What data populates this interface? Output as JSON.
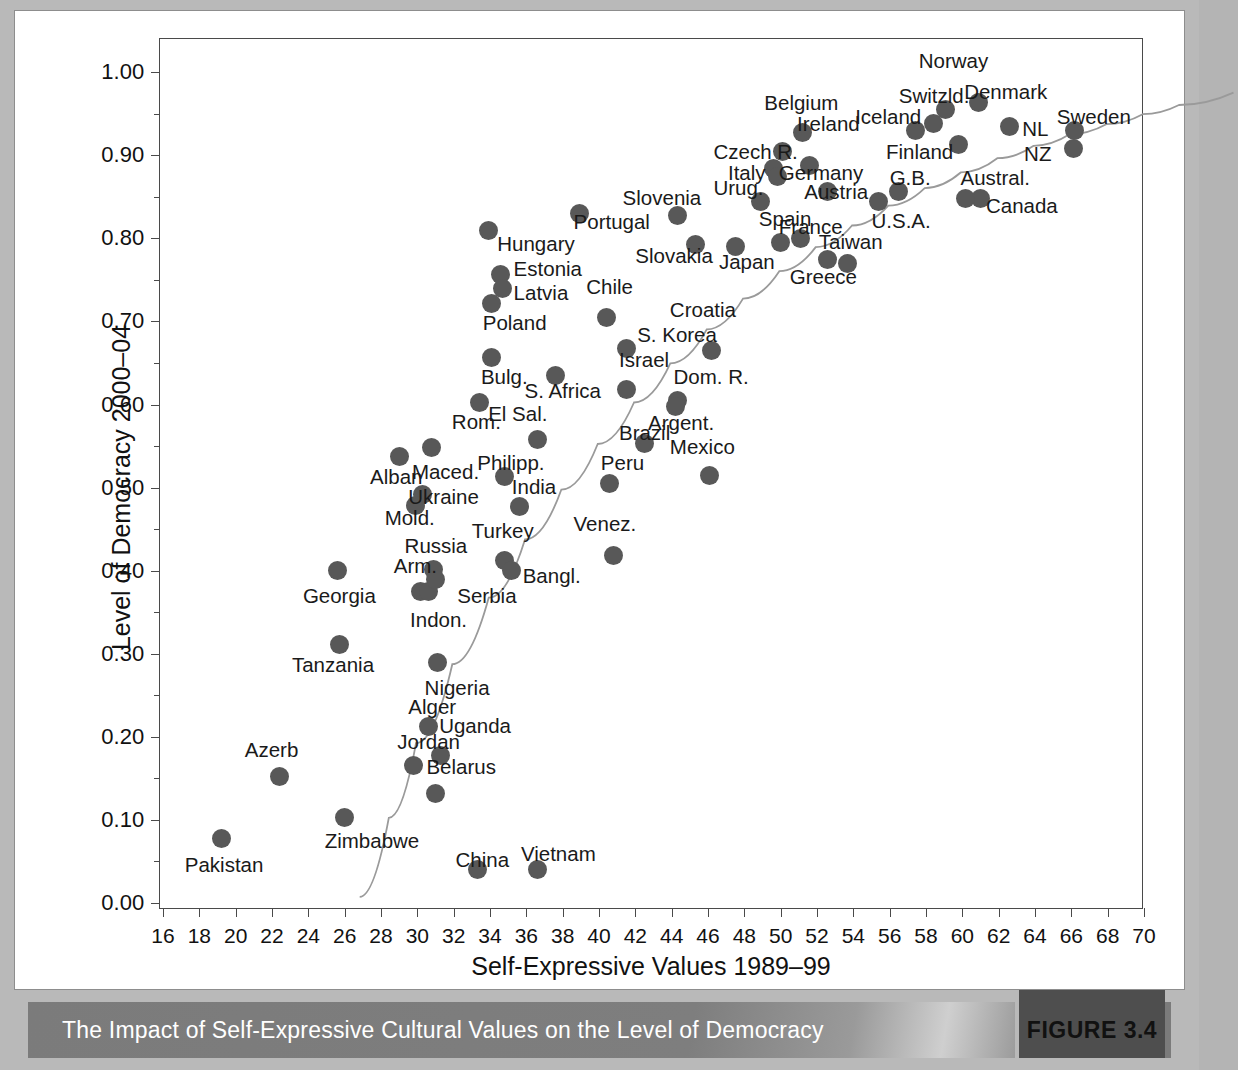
{
  "figure": {
    "caption": "The Impact of Self-Expressive Cultural Values on the Level of Democracy",
    "number_label": "FIGURE 3.4",
    "accent_color": "#7b7b7b",
    "marker_color": "#585858",
    "page_background": "#b9b9b9"
  },
  "chart_data": {
    "type": "scatter",
    "title": "The Impact of Self-Expressive Cultural Values on the Level of Democracy",
    "xlabel": "Self-Expressive Values 1989–99",
    "ylabel": "Level of Democracy 2000–04",
    "xlim": [
      16,
      70
    ],
    "ylim": [
      0.0,
      1.04
    ],
    "grid": false,
    "legend": null,
    "x_ticks": [
      16,
      18,
      20,
      22,
      24,
      26,
      28,
      30,
      32,
      34,
      36,
      38,
      40,
      42,
      44,
      46,
      48,
      50,
      52,
      54,
      56,
      58,
      60,
      62,
      64,
      66,
      68,
      70
    ],
    "x_tick_labels": [
      "16",
      "18",
      "20",
      "22",
      "24",
      "26",
      "28",
      "30",
      "32",
      "34",
      "36",
      "38",
      "40",
      "42",
      "44",
      "46",
      "48",
      "50",
      "52",
      "54",
      "56",
      "58",
      "60",
      "62",
      "64",
      "66",
      "68",
      "70"
    ],
    "y_ticks": [
      0.0,
      0.05,
      0.1,
      0.15,
      0.2,
      0.25,
      0.3,
      0.35,
      0.4,
      0.45,
      0.5,
      0.55,
      0.6,
      0.65,
      0.7,
      0.75,
      0.8,
      0.85,
      0.9,
      0.95,
      1.0
    ],
    "y_major_ticks": [
      0.0,
      0.1,
      0.2,
      0.3,
      0.4,
      0.5,
      0.6,
      0.7,
      0.8,
      0.9,
      1.0
    ],
    "y_tick_labels": [
      "0.00",
      "0.10",
      "0.20",
      "0.30",
      "0.40",
      "0.50",
      "0.60",
      "0.70",
      "0.80",
      "0.90",
      "1.00"
    ],
    "trend_line": {
      "style": "solid-thin-curve",
      "color": "#9a9a9a",
      "points": [
        [
          18.9,
          0.04
        ],
        [
          20.5,
          0.135
        ],
        [
          22.0,
          0.225
        ],
        [
          24.0,
          0.32
        ],
        [
          26.0,
          0.4
        ],
        [
          28.0,
          0.47
        ],
        [
          30.0,
          0.53
        ],
        [
          32.0,
          0.585
        ],
        [
          34.0,
          0.635
        ],
        [
          36.0,
          0.682
        ],
        [
          38.0,
          0.723
        ],
        [
          40.0,
          0.76
        ],
        [
          42.0,
          0.793
        ],
        [
          44.0,
          0.822
        ],
        [
          46.0,
          0.848
        ],
        [
          48.0,
          0.872
        ],
        [
          50.0,
          0.893
        ],
        [
          52.0,
          0.912
        ],
        [
          54.0,
          0.929
        ],
        [
          56.0,
          0.944
        ],
        [
          58.0,
          0.958
        ],
        [
          60.0,
          0.97
        ],
        [
          62.0,
          0.982
        ],
        [
          64.0,
          0.993
        ],
        [
          67.0,
          1.008
        ]
      ]
    },
    "points": [
      {
        "label": "Norway",
        "x": 59.1,
        "y": 0.955,
        "lx": 57.6,
        "ly": 1.012,
        "anchor": "start"
      },
      {
        "label": "Denmark",
        "x": 60.9,
        "y": 0.963,
        "lx": 60.1,
        "ly": 0.975,
        "anchor": "start"
      },
      {
        "label": "Switzld.",
        "x": 58.4,
        "y": 0.938,
        "lx": 56.5,
        "ly": 0.97,
        "anchor": "start"
      },
      {
        "label": "Iceland",
        "x": 57.4,
        "y": 0.93,
        "lx": 54.1,
        "ly": 0.945,
        "anchor": "start"
      },
      {
        "label": "NL",
        "x": 62.6,
        "y": 0.935,
        "lx": 63.3,
        "ly": 0.93,
        "anchor": "start"
      },
      {
        "label": "Sweden",
        "x": 66.2,
        "y": 0.93,
        "lx": 65.2,
        "ly": 0.945,
        "anchor": "start"
      },
      {
        "label": "NZ",
        "x": 66.1,
        "y": 0.908,
        "lx": 63.4,
        "ly": 0.9,
        "anchor": "start"
      },
      {
        "label": "Belgium",
        "x": 51.2,
        "y": 0.927,
        "lx": 49.1,
        "ly": 0.962,
        "anchor": "start"
      },
      {
        "label": "Ireland",
        "x": 50.1,
        "y": 0.905,
        "lx": 50.9,
        "ly": 0.937,
        "anchor": "start"
      },
      {
        "label": "Finland",
        "x": 59.8,
        "y": 0.913,
        "lx": 55.8,
        "ly": 0.903,
        "anchor": "start"
      },
      {
        "label": "Czech R.",
        "x": 49.6,
        "y": 0.884,
        "lx": 46.3,
        "ly": 0.903,
        "anchor": "start"
      },
      {
        "label": "Germany",
        "x": 51.6,
        "y": 0.888,
        "lx": 49.9,
        "ly": 0.878,
        "anchor": "start"
      },
      {
        "label": "Italy",
        "x": 49.8,
        "y": 0.874,
        "lx": 47.1,
        "ly": 0.878,
        "anchor": "start"
      },
      {
        "label": "Austria",
        "x": 52.6,
        "y": 0.857,
        "lx": 51.3,
        "ly": 0.855,
        "anchor": "start"
      },
      {
        "label": "G.B.",
        "x": 56.5,
        "y": 0.857,
        "lx": 56.0,
        "ly": 0.872,
        "anchor": "start"
      },
      {
        "label": "Austral.",
        "x": 61.0,
        "y": 0.848,
        "lx": 59.9,
        "ly": 0.872,
        "anchor": "start"
      },
      {
        "label": "Canada",
        "x": 60.2,
        "y": 0.848,
        "lx": 61.3,
        "ly": 0.838,
        "anchor": "start"
      },
      {
        "label": "U.S.A.",
        "x": 55.4,
        "y": 0.845,
        "lx": 55.0,
        "ly": 0.82,
        "anchor": "start"
      },
      {
        "label": "Urug.",
        "x": 48.9,
        "y": 0.845,
        "lx": 46.3,
        "ly": 0.86,
        "anchor": "start"
      },
      {
        "label": "Slovenia",
        "x": 44.3,
        "y": 0.827,
        "lx": 41.3,
        "ly": 0.848,
        "anchor": "start"
      },
      {
        "label": "Spain",
        "x": 50.0,
        "y": 0.795,
        "lx": 48.8,
        "ly": 0.822,
        "anchor": "start"
      },
      {
        "label": "France",
        "x": 51.1,
        "y": 0.8,
        "lx": 49.9,
        "ly": 0.812,
        "anchor": "start"
      },
      {
        "label": "Portugal",
        "x": 38.9,
        "y": 0.83,
        "lx": 38.6,
        "ly": 0.818,
        "anchor": "start"
      },
      {
        "label": "Hungary",
        "x": 33.9,
        "y": 0.81,
        "lx": 34.4,
        "ly": 0.792,
        "anchor": "start"
      },
      {
        "label": "Slovakia",
        "x": 45.3,
        "y": 0.793,
        "lx": 42.0,
        "ly": 0.777,
        "anchor": "start"
      },
      {
        "label": "Japan",
        "x": 47.5,
        "y": 0.79,
        "lx": 46.6,
        "ly": 0.77,
        "anchor": "start"
      },
      {
        "label": "Taiwan",
        "x": 52.6,
        "y": 0.775,
        "lx": 52.1,
        "ly": 0.795,
        "anchor": "start"
      },
      {
        "label": "Greece",
        "x": 53.7,
        "y": 0.77,
        "lx": 50.5,
        "ly": 0.752,
        "anchor": "start"
      },
      {
        "label": "Estonia",
        "x": 34.6,
        "y": 0.757,
        "lx": 35.3,
        "ly": 0.762,
        "anchor": "start"
      },
      {
        "label": "Latvia",
        "x": 34.7,
        "y": 0.74,
        "lx": 35.3,
        "ly": 0.733,
        "anchor": "start"
      },
      {
        "label": "Chile",
        "x": 40.4,
        "y": 0.705,
        "lx": 39.3,
        "ly": 0.74,
        "anchor": "start"
      },
      {
        "label": "Poland",
        "x": 34.1,
        "y": 0.722,
        "lx": 33.6,
        "ly": 0.697,
        "anchor": "start"
      },
      {
        "label": "Croatia",
        "x": 46.2,
        "y": 0.665,
        "lx": 43.9,
        "ly": 0.712,
        "anchor": "start"
      },
      {
        "label": "S. Korea",
        "x": 41.5,
        "y": 0.667,
        "lx": 42.1,
        "ly": 0.682,
        "anchor": "start"
      },
      {
        "label": "Bulg.",
        "x": 34.1,
        "y": 0.657,
        "lx": 33.5,
        "ly": 0.632,
        "anchor": "start"
      },
      {
        "label": "Israel",
        "x": 41.5,
        "y": 0.618,
        "lx": 41.1,
        "ly": 0.653,
        "anchor": "start"
      },
      {
        "label": "S. Africa",
        "x": 37.6,
        "y": 0.635,
        "lx": 35.9,
        "ly": 0.615,
        "anchor": "start"
      },
      {
        "label": "Dom. R.",
        "x": 44.3,
        "y": 0.605,
        "lx": 44.1,
        "ly": 0.632,
        "anchor": "start"
      },
      {
        "label": "Rom.",
        "x": 33.4,
        "y": 0.602,
        "lx": 31.9,
        "ly": 0.578,
        "anchor": "start"
      },
      {
        "label": "El Sal.",
        "x": 36.6,
        "y": 0.558,
        "lx": 33.9,
        "ly": 0.588,
        "anchor": "start"
      },
      {
        "label": "Argent.",
        "x": 44.2,
        "y": 0.598,
        "lx": 42.7,
        "ly": 0.577,
        "anchor": "start"
      },
      {
        "label": "Brazil",
        "x": 42.5,
        "y": 0.553,
        "lx": 41.1,
        "ly": 0.565,
        "anchor": "start"
      },
      {
        "label": "Mexico",
        "x": 46.1,
        "y": 0.515,
        "lx": 43.9,
        "ly": 0.548,
        "anchor": "start"
      },
      {
        "label": "Maced.",
        "x": 30.8,
        "y": 0.548,
        "lx": 29.7,
        "ly": 0.518,
        "anchor": "start"
      },
      {
        "label": "Alban",
        "x": 29.0,
        "y": 0.537,
        "lx": 27.4,
        "ly": 0.512,
        "anchor": "start"
      },
      {
        "label": "Philipp.",
        "x": 34.8,
        "y": 0.513,
        "lx": 33.3,
        "ly": 0.528,
        "anchor": "start"
      },
      {
        "label": "Ukraine",
        "x": 30.3,
        "y": 0.492,
        "lx": 29.5,
        "ly": 0.488,
        "anchor": "start"
      },
      {
        "label": "Mold.",
        "x": 29.9,
        "y": 0.478,
        "lx": 28.2,
        "ly": 0.462,
        "anchor": "start"
      },
      {
        "label": "India",
        "x": 35.6,
        "y": 0.477,
        "lx": 35.2,
        "ly": 0.5,
        "anchor": "start"
      },
      {
        "label": "Peru",
        "x": 40.6,
        "y": 0.505,
        "lx": 40.1,
        "ly": 0.528,
        "anchor": "start"
      },
      {
        "label": "Venez.",
        "x": 40.8,
        "y": 0.418,
        "lx": 38.6,
        "ly": 0.455,
        "anchor": "start"
      },
      {
        "label": "Turkey",
        "x": 34.8,
        "y": 0.412,
        "lx": 33.0,
        "ly": 0.447,
        "anchor": "start"
      },
      {
        "label": "Russia",
        "x": 30.9,
        "y": 0.402,
        "lx": 29.3,
        "ly": 0.428,
        "anchor": "start"
      },
      {
        "label": "Bangl.",
        "x": 35.2,
        "y": 0.4,
        "lx": 35.8,
        "ly": 0.393,
        "anchor": "start"
      },
      {
        "label": "Arm.",
        "x": 30.2,
        "y": 0.375,
        "lx": 28.7,
        "ly": 0.405,
        "anchor": "start"
      },
      {
        "label": "Georgia",
        "x": 25.6,
        "y": 0.4,
        "lx": 23.7,
        "ly": 0.368,
        "anchor": "start"
      },
      {
        "label": "Serbia",
        "x": 30.6,
        "y": 0.375,
        "lx": 32.2,
        "ly": 0.368,
        "anchor": "start"
      },
      {
        "label": "Indon.",
        "x": 31.0,
        "y": 0.39,
        "lx": 29.6,
        "ly": 0.34,
        "anchor": "start"
      },
      {
        "label": "Tanzania",
        "x": 25.7,
        "y": 0.311,
        "lx": 23.1,
        "ly": 0.285,
        "anchor": "start"
      },
      {
        "label": "Nigeria",
        "x": 31.1,
        "y": 0.29,
        "lx": 30.4,
        "ly": 0.258,
        "anchor": "start"
      },
      {
        "label": "Alger",
        "x": 30.6,
        "y": 0.212,
        "lx": 29.5,
        "ly": 0.235,
        "anchor": "start"
      },
      {
        "label": "Uganda",
        "x": 31.3,
        "y": 0.178,
        "lx": 31.2,
        "ly": 0.212,
        "anchor": "start"
      },
      {
        "label": "Jordan",
        "x": 29.8,
        "y": 0.165,
        "lx": 28.9,
        "ly": 0.193,
        "anchor": "start"
      },
      {
        "label": "Belarus",
        "x": 31.0,
        "y": 0.132,
        "lx": 30.5,
        "ly": 0.163,
        "anchor": "start"
      },
      {
        "label": "Azerb",
        "x": 22.4,
        "y": 0.152,
        "lx": 20.5,
        "ly": 0.183,
        "anchor": "start"
      },
      {
        "label": "Zimbabwe",
        "x": 26.0,
        "y": 0.103,
        "lx": 24.9,
        "ly": 0.073,
        "anchor": "start"
      },
      {
        "label": "Pakistan",
        "x": 19.2,
        "y": 0.078,
        "lx": 17.2,
        "ly": 0.045,
        "anchor": "start"
      },
      {
        "label": "China",
        "x": 33.3,
        "y": 0.04,
        "lx": 32.1,
        "ly": 0.05,
        "anchor": "start"
      },
      {
        "label": "Vietnam",
        "x": 36.6,
        "y": 0.04,
        "lx": 35.7,
        "ly": 0.058,
        "anchor": "start"
      }
    ]
  }
}
